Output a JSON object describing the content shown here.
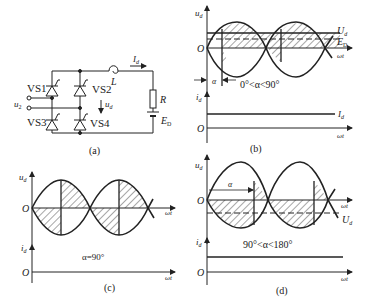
{
  "figure": {
    "panels": {
      "a": {
        "caption": "(a)",
        "components": {
          "thyristor_1": "VS1",
          "thyristor_2": "VS2",
          "thyristor_3": "VS3",
          "thyristor_4": "VS4",
          "inductor": "L",
          "resistor": "R",
          "source_emf": "E",
          "source_emf_sub": "D",
          "input_voltage": "u",
          "input_voltage_sub": "2",
          "output_voltage": "u",
          "output_voltage_sub": "d",
          "current": "I",
          "current_sub": "d"
        }
      },
      "b": {
        "caption": "(b)",
        "ud_axis_label": "u",
        "ud_axis_sub": "d",
        "id_axis_label": "i",
        "id_axis_sub": "d",
        "origin": "O",
        "x_axis_label": "ωt",
        "Ud_label": "U",
        "Ud_sub": "d",
        "ED_label": "E",
        "ED_sub": "D",
        "alpha_label": "α",
        "condition": "0°<α<90°",
        "Id_label": "I",
        "Id_sub": "d"
      },
      "c": {
        "caption": "(c)",
        "ud_axis_label": "u",
        "ud_axis_sub": "d",
        "id_axis_label": "i",
        "id_axis_sub": "d",
        "origin": "O",
        "x_axis_label": "ωt",
        "condition": "α=90°"
      },
      "d": {
        "caption": "(d)",
        "ud_axis_label": "u",
        "ud_axis_sub": "d",
        "id_axis_label": "i",
        "id_axis_sub": "d",
        "origin": "O",
        "x_axis_label": "ωt",
        "alpha_label": "α",
        "Ud_label": "U",
        "Ud_sub": "d",
        "condition": "90°<α<180°"
      }
    }
  }
}
